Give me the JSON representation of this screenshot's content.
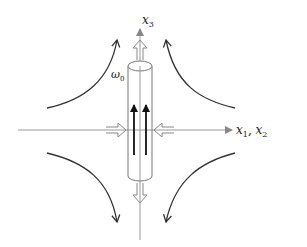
{
  "diagram": {
    "labels": {
      "vertical_axis": "x",
      "vertical_axis_sub": "3",
      "horizontal_axis_a": "x",
      "horizontal_axis_a_sub": "1",
      "horizontal_axis_sep": ", ",
      "horizontal_axis_b": "x",
      "horizontal_axis_b_sub": "2",
      "vorticity": "ω",
      "vorticity_sub": "0"
    },
    "colors": {
      "axis": "#888888",
      "flow_curve": "#333333",
      "vortex_arrow": "#111111",
      "cylinder": "#777777",
      "hollow_arrow": "#888888"
    }
  }
}
